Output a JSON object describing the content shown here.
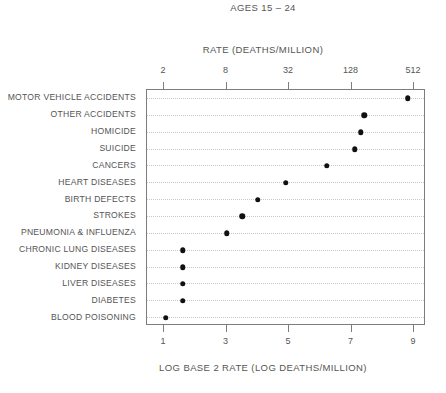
{
  "chart_data": {
    "type": "scatter",
    "title": "AGES 15 – 24",
    "xlabel_top": "RATE (DEATHS/MILLION)",
    "xlabel_bottom": "LOG BASE 2 RATE (LOG DEATHS/MILLION)",
    "ylabel": "",
    "grid": true,
    "legend": "none",
    "orientation": "horizontal",
    "xlim_log2": [
      0.4,
      9.4
    ],
    "top_axis": {
      "label": "RATE (DEATHS/MILLION)",
      "tick_labels": [
        "2",
        "8",
        "32",
        "128",
        "512"
      ],
      "tick_values_log2": [
        1,
        3,
        5,
        7,
        9
      ],
      "tick_values_rate": [
        2,
        8,
        32,
        128,
        512
      ]
    },
    "bottom_axis": {
      "label": "LOG BASE 2 RATE (LOG DEATHS/MILLION)",
      "tick_labels": [
        "1",
        "3",
        "5",
        "7",
        "9"
      ],
      "tick_values": [
        1,
        3,
        5,
        7,
        9
      ]
    },
    "categories": [
      "MOTOR VEHICLE ACCIDENTS",
      "OTHER ACCIDENTS",
      "HOMICIDE",
      "SUICIDE",
      "CANCERS",
      "HEART DISEASES",
      "BIRTH DEFECTS",
      "STROKES",
      "PNEUMONIA & INFLUENZA",
      "CHRONIC LUNG DISEASES",
      "KIDNEY DISEASES",
      "LIVER DISEASES",
      "DIABETES",
      "BLOOD POISONING"
    ],
    "values": [
      8.8,
      7.4,
      7.3,
      7.1,
      6.2,
      4.9,
      4.0,
      3.5,
      3.0,
      1.6,
      1.6,
      1.6,
      1.6,
      1.05
    ],
    "values_rate": [
      445,
      169,
      158,
      137,
      73,
      30,
      16,
      11,
      8,
      3,
      3,
      3,
      3,
      2
    ],
    "colors": {
      "marker": "#111111",
      "frame": "#7d7d7d",
      "gridline": "#c8c8c8",
      "text": "#555555",
      "background": "#ffffff"
    }
  }
}
